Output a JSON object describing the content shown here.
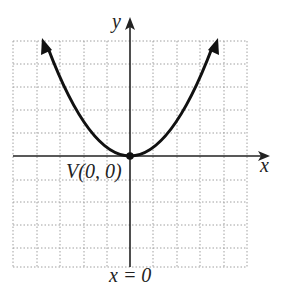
{
  "diagram": {
    "type": "parabola-graph",
    "labels": {
      "y_axis": "y",
      "x_axis": "x",
      "vertex": "V(0, 0)",
      "axis_of_symmetry": "x = 0"
    },
    "grid": {
      "x_range": [
        -5,
        5
      ],
      "y_range": [
        -5,
        5
      ],
      "style": "dotted"
    },
    "curve": {
      "equation_shape": "upward parabola",
      "vertex": [
        0,
        0
      ],
      "arrows": "both ends"
    },
    "colors": {
      "curve": "#111111",
      "axes": "#222222",
      "grid": "#999999"
    }
  }
}
